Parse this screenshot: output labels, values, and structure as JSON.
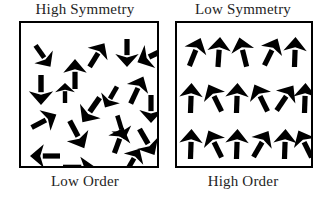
{
  "figure": {
    "type": "diagram",
    "background_color": "#ffffff",
    "ink_color": "#000000",
    "text_color": "#242424",
    "border_width_px": 2.5
  },
  "panels": [
    {
      "id": "high-symmetry-low-order",
      "top_label": "High Symmetry",
      "bottom_label": "Low Order",
      "arrow_count": 19,
      "arrangement": "random",
      "arrows": [
        {
          "x": 22,
          "y": 20,
          "angle": 145,
          "len": 26,
          "w": 5.0
        },
        {
          "x": 54,
          "y": 36,
          "angle": 0,
          "len": 30,
          "w": 5.2
        },
        {
          "x": 76,
          "y": 18,
          "angle": 32,
          "len": 28,
          "w": 5.2
        },
        {
          "x": 106,
          "y": 16,
          "angle": 180,
          "len": 28,
          "w": 5.2
        },
        {
          "x": 130,
          "y": 18,
          "angle": 245,
          "len": 30,
          "w": 5.6
        },
        {
          "x": 20,
          "y": 52,
          "angle": 180,
          "len": 30,
          "w": 5.4
        },
        {
          "x": 116,
          "y": 52,
          "angle": 25,
          "len": 30,
          "w": 5.2
        },
        {
          "x": 23,
          "y": 84,
          "angle": 62,
          "len": 28,
          "w": 5.2
        },
        {
          "x": 70,
          "y": 72,
          "angle": 215,
          "len": 30,
          "w": 5.6
        },
        {
          "x": 130,
          "y": 72,
          "angle": 180,
          "len": 28,
          "w": 5.2
        },
        {
          "x": 56,
          "y": 96,
          "angle": 152,
          "len": 31,
          "w": 5.4
        },
        {
          "x": 100,
          "y": 92,
          "angle": 163,
          "len": 25,
          "w": 4.6
        },
        {
          "x": 98,
          "y": 104,
          "angle": 20,
          "len": 27,
          "w": 5.2
        },
        {
          "x": 126,
          "y": 104,
          "angle": 150,
          "len": 30,
          "w": 5.4
        },
        {
          "x": 24,
          "y": 118,
          "angle": 270,
          "len": 30,
          "w": 5.2
        },
        {
          "x": 58,
          "y": 128,
          "angle": 90,
          "len": 32,
          "w": 4.6
        },
        {
          "x": 112,
          "y": 124,
          "angle": 30,
          "len": 26,
          "w": 5.0
        },
        {
          "x": 90,
          "y": 62,
          "angle": 210,
          "len": 24,
          "w": 4.8
        },
        {
          "x": 44,
          "y": 60,
          "angle": 0,
          "len": 20,
          "w": 4.4
        }
      ]
    },
    {
      "id": "low-symmetry-high-order",
      "top_label": "Low Symmetry",
      "bottom_label": "High Order",
      "arrow_count": 17,
      "arrangement": "grid-3-rows",
      "arrows": [
        {
          "x": 18,
          "y": 14,
          "angle": 22,
          "len": 30,
          "w": 5.2
        },
        {
          "x": 42,
          "y": 14,
          "angle": 4,
          "len": 30,
          "w": 5.2
        },
        {
          "x": 66,
          "y": 14,
          "angle": -14,
          "len": 30,
          "w": 5.2
        },
        {
          "x": 94,
          "y": 14,
          "angle": 26,
          "len": 30,
          "w": 5.2
        },
        {
          "x": 118,
          "y": 14,
          "angle": 2,
          "len": 30,
          "w": 5.2
        },
        {
          "x": 14,
          "y": 60,
          "angle": 2,
          "len": 30,
          "w": 5.2
        },
        {
          "x": 38,
          "y": 60,
          "angle": -26,
          "len": 30,
          "w": 5.2
        },
        {
          "x": 60,
          "y": 60,
          "angle": 2,
          "len": 30,
          "w": 5.2
        },
        {
          "x": 84,
          "y": 60,
          "angle": -26,
          "len": 30,
          "w": 5.2
        },
        {
          "x": 108,
          "y": 60,
          "angle": 34,
          "len": 30,
          "w": 5.2
        },
        {
          "x": 128,
          "y": 60,
          "angle": 2,
          "len": 30,
          "w": 5.2
        },
        {
          "x": 14,
          "y": 106,
          "angle": 2,
          "len": 30,
          "w": 5.2
        },
        {
          "x": 38,
          "y": 106,
          "angle": -26,
          "len": 30,
          "w": 5.2
        },
        {
          "x": 60,
          "y": 106,
          "angle": 2,
          "len": 30,
          "w": 5.2
        },
        {
          "x": 84,
          "y": 106,
          "angle": 30,
          "len": 30,
          "w": 5.2
        },
        {
          "x": 108,
          "y": 106,
          "angle": 2,
          "len": 30,
          "w": 5.2
        },
        {
          "x": 128,
          "y": 106,
          "angle": -26,
          "len": 30,
          "w": 5.2
        }
      ]
    }
  ]
}
